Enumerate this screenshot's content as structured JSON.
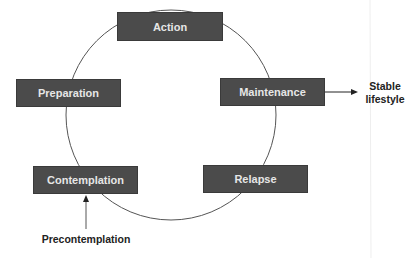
{
  "diagram": {
    "stages": [
      {
        "id": "action",
        "label": "Action"
      },
      {
        "id": "maintenance",
        "label": "Maintenance"
      },
      {
        "id": "relapse",
        "label": "Relapse"
      },
      {
        "id": "contemplation",
        "label": "Contemplation"
      },
      {
        "id": "preparation",
        "label": "Preparation"
      }
    ],
    "entry": {
      "label": "Precontemplation",
      "points_to": "contemplation"
    },
    "exit": {
      "line1": "Stable",
      "line2": "lifestyle",
      "from": "maintenance"
    },
    "colors": {
      "box": "#4b4b4b",
      "box_text": "#e6e6e6",
      "line": "#555555"
    }
  }
}
